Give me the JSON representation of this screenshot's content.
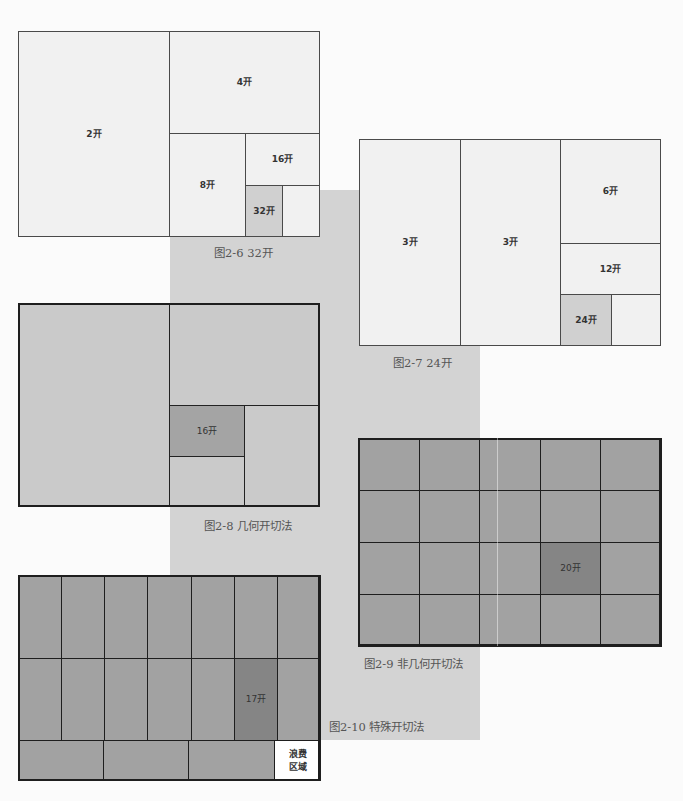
{
  "colors": {
    "background": "#fbfbfb",
    "band": "#d3d3d3",
    "light_cell": "#f1f1f1",
    "light_highlight": "#d0d0d0",
    "mid_cell": "#cacaca",
    "mid_highlight": "#a4a4a4",
    "dark_cell": "#a2a2a2",
    "dark_highlight": "#858585",
    "waste": "#ffffff"
  },
  "figures": [
    {
      "id": "fig-2-6",
      "caption": "图2-6   32开",
      "cells": [
        {
          "label": "2开"
        },
        {
          "label": "4开"
        },
        {
          "label": "8开"
        },
        {
          "label": "16开"
        },
        {
          "label": "32开",
          "highlight": true
        },
        {
          "label": ""
        }
      ]
    },
    {
      "id": "fig-2-7",
      "caption": "图2-7   24开",
      "cells": [
        {
          "label": "3开"
        },
        {
          "label": "3开"
        },
        {
          "label": "6开"
        },
        {
          "label": "12开"
        },
        {
          "label": "24开",
          "highlight": true
        },
        {
          "label": ""
        }
      ]
    },
    {
      "id": "fig-2-8",
      "caption": "图2-8   几何开切法",
      "cells": [
        {
          "label": ""
        },
        {
          "label": ""
        },
        {
          "label": "16开",
          "highlight": true
        },
        {
          "label": ""
        },
        {
          "label": ""
        }
      ]
    },
    {
      "id": "fig-2-9",
      "caption": "图2-9   非几何开切法",
      "grid": {
        "columns": 5,
        "rows": 4
      },
      "highlight_label": "20开",
      "highlight_cell": {
        "col": 4,
        "row": 3
      }
    },
    {
      "id": "fig-2-10",
      "caption": "图2-10   特殊开切法",
      "grid": {
        "columns": 7,
        "rows": 2,
        "bottom_row_pieces": 3
      },
      "highlight_label": "17开",
      "highlight_cell": {
        "col": 6,
        "row": 2
      },
      "waste_label_line1": "浪费",
      "waste_label_line2": "区域"
    }
  ]
}
